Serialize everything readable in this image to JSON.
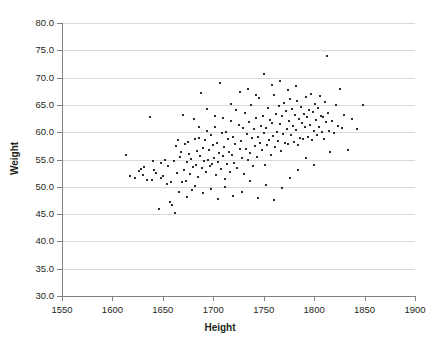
{
  "chart_data": {
    "type": "scatter",
    "title": "",
    "xlabel": "Height",
    "ylabel": "Weight",
    "xlim": [
      1550,
      1900
    ],
    "ylim": [
      30.0,
      80.0
    ],
    "xticks": [
      "1550",
      "1600",
      "1650",
      "1700",
      "1750",
      "1800",
      "1850",
      "1900"
    ],
    "yticks": [
      "30.0",
      "35.0",
      "40.0",
      "45.0",
      "50.0",
      "55.0",
      "60.0",
      "65.0",
      "70.0",
      "75.0",
      "80.0"
    ],
    "grid": true,
    "legend": null,
    "marker_color": "#2b2b2b",
    "grid_color": "#d9d9d9",
    "axis_color": "#808080",
    "n_points": 208,
    "points": [
      [
        1613,
        55.8
      ],
      [
        1617,
        52.0
      ],
      [
        1622,
        51.6
      ],
      [
        1626,
        52.9
      ],
      [
        1628,
        53.3
      ],
      [
        1631,
        53.6
      ],
      [
        1634,
        51.3
      ],
      [
        1637,
        62.8
      ],
      [
        1639,
        51.2
      ],
      [
        1641,
        53.0
      ],
      [
        1643,
        52.5
      ],
      [
        1646,
        45.9
      ],
      [
        1648,
        54.4
      ],
      [
        1650,
        52.0
      ],
      [
        1652,
        54.9
      ],
      [
        1654,
        50.6
      ],
      [
        1655,
        53.8
      ],
      [
        1657,
        47.3
      ],
      [
        1659,
        46.6
      ],
      [
        1661,
        54.7
      ],
      [
        1662,
        45.2
      ],
      [
        1663,
        57.5
      ],
      [
        1664,
        52.6
      ],
      [
        1666,
        49.1
      ],
      [
        1667,
        55.4
      ],
      [
        1668,
        56.3
      ],
      [
        1669,
        50.9
      ],
      [
        1670,
        63.2
      ],
      [
        1671,
        53.1
      ],
      [
        1672,
        57.9
      ],
      [
        1673,
        51.0
      ],
      [
        1674,
        54.5
      ],
      [
        1675,
        58.2
      ],
      [
        1676,
        56.0
      ],
      [
        1677,
        52.3
      ],
      [
        1678,
        55.1
      ],
      [
        1679,
        49.4
      ],
      [
        1680,
        53.7
      ],
      [
        1681,
        62.4
      ],
      [
        1682,
        58.8
      ],
      [
        1683,
        54.0
      ],
      [
        1684,
        56.6
      ],
      [
        1685,
        51.8
      ],
      [
        1686,
        59.0
      ],
      [
        1687,
        55.6
      ],
      [
        1688,
        67.2
      ],
      [
        1689,
        53.4
      ],
      [
        1690,
        57.1
      ],
      [
        1691,
        54.8
      ],
      [
        1692,
        58.5
      ],
      [
        1693,
        52.8
      ],
      [
        1694,
        60.3
      ],
      [
        1695,
        55.0
      ],
      [
        1696,
        56.8
      ],
      [
        1697,
        53.9
      ],
      [
        1698,
        59.4
      ],
      [
        1699,
        54.2
      ],
      [
        1700,
        57.6
      ],
      [
        1701,
        55.3
      ],
      [
        1702,
        61.0
      ],
      [
        1703,
        52.1
      ],
      [
        1704,
        58.0
      ],
      [
        1705,
        54.6
      ],
      [
        1706,
        56.1
      ],
      [
        1707,
        69.0
      ],
      [
        1708,
        53.2
      ],
      [
        1709,
        59.8
      ],
      [
        1710,
        55.7
      ],
      [
        1711,
        57.3
      ],
      [
        1712,
        51.4
      ],
      [
        1713,
        60.0
      ],
      [
        1714,
        54.1
      ],
      [
        1715,
        58.7
      ],
      [
        1716,
        56.4
      ],
      [
        1717,
        52.7
      ],
      [
        1718,
        62.0
      ],
      [
        1719,
        55.9
      ],
      [
        1720,
        59.2
      ],
      [
        1721,
        54.3
      ],
      [
        1722,
        57.8
      ],
      [
        1723,
        64.0
      ],
      [
        1724,
        53.5
      ],
      [
        1725,
        61.4
      ],
      [
        1726,
        56.9
      ],
      [
        1727,
        58.3
      ],
      [
        1728,
        55.2
      ],
      [
        1729,
        60.7
      ],
      [
        1730,
        52.4
      ],
      [
        1731,
        63.6
      ],
      [
        1732,
        57.0
      ],
      [
        1733,
        59.6
      ],
      [
        1734,
        54.9
      ],
      [
        1735,
        61.8
      ],
      [
        1736,
        56.2
      ],
      [
        1737,
        65.0
      ],
      [
        1738,
        58.9
      ],
      [
        1739,
        53.8
      ],
      [
        1740,
        60.5
      ],
      [
        1741,
        57.4
      ],
      [
        1742,
        62.6
      ],
      [
        1743,
        55.5
      ],
      [
        1744,
        59.1
      ],
      [
        1745,
        66.2
      ],
      [
        1746,
        58.1
      ],
      [
        1747,
        61.2
      ],
      [
        1748,
        56.7
      ],
      [
        1749,
        63.0
      ],
      [
        1750,
        59.9
      ],
      [
        1751,
        54.0
      ],
      [
        1752,
        60.8
      ],
      [
        1753,
        57.7
      ],
      [
        1754,
        64.4
      ],
      [
        1755,
        58.6
      ],
      [
        1756,
        62.2
      ],
      [
        1757,
        55.8
      ],
      [
        1758,
        61.6
      ],
      [
        1759,
        59.3
      ],
      [
        1760,
        66.8
      ],
      [
        1761,
        57.2
      ],
      [
        1762,
        63.4
      ],
      [
        1763,
        60.1
      ],
      [
        1764,
        58.4
      ],
      [
        1765,
        64.8
      ],
      [
        1766,
        61.5
      ],
      [
        1767,
        56.5
      ],
      [
        1768,
        62.9
      ],
      [
        1769,
        59.7
      ],
      [
        1770,
        65.4
      ],
      [
        1771,
        58.0
      ],
      [
        1772,
        63.8
      ],
      [
        1773,
        60.6
      ],
      [
        1774,
        57.9
      ],
      [
        1775,
        62.1
      ],
      [
        1776,
        66.0
      ],
      [
        1777,
        59.5
      ],
      [
        1778,
        64.2
      ],
      [
        1779,
        61.1
      ],
      [
        1780,
        58.2
      ],
      [
        1781,
        63.1
      ],
      [
        1782,
        60.4
      ],
      [
        1783,
        65.8
      ],
      [
        1784,
        57.6
      ],
      [
        1785,
        62.5
      ],
      [
        1786,
        59.0
      ],
      [
        1787,
        64.6
      ],
      [
        1788,
        61.7
      ],
      [
        1789,
        58.8
      ],
      [
        1790,
        63.3
      ],
      [
        1791,
        60.9
      ],
      [
        1792,
        66.4
      ],
      [
        1793,
        62.7
      ],
      [
        1794,
        59.2
      ],
      [
        1795,
        64.0
      ],
      [
        1796,
        61.3
      ],
      [
        1797,
        67.0
      ],
      [
        1798,
        58.5
      ],
      [
        1799,
        63.7
      ],
      [
        1800,
        60.2
      ],
      [
        1801,
        65.2
      ],
      [
        1802,
        62.3
      ],
      [
        1803,
        59.4
      ],
      [
        1804,
        64.5
      ],
      [
        1805,
        61.0
      ],
      [
        1806,
        66.6
      ],
      [
        1807,
        63.0
      ],
      [
        1808,
        60.0
      ],
      [
        1809,
        62.8
      ],
      [
        1810,
        58.7
      ],
      [
        1811,
        65.6
      ],
      [
        1812,
        61.9
      ],
      [
        1813,
        74.0
      ],
      [
        1814,
        63.5
      ],
      [
        1815,
        60.3
      ],
      [
        1816,
        56.4
      ],
      [
        1818,
        62.0
      ],
      [
        1820,
        59.8
      ],
      [
        1822,
        64.9
      ],
      [
        1824,
        61.2
      ],
      [
        1826,
        68.0
      ],
      [
        1828,
        60.7
      ],
      [
        1830,
        63.2
      ],
      [
        1834,
        56.8
      ],
      [
        1838,
        62.4
      ],
      [
        1842,
        60.5
      ],
      [
        1848,
        65.0
      ],
      [
        1665,
        58.6
      ],
      [
        1682,
        50.2
      ],
      [
        1690,
        48.8
      ],
      [
        1698,
        49.6
      ],
      [
        1705,
        47.8
      ],
      [
        1712,
        50.0
      ],
      [
        1720,
        48.4
      ],
      [
        1728,
        49.0
      ],
      [
        1736,
        51.1
      ],
      [
        1744,
        48.0
      ],
      [
        1752,
        50.4
      ],
      [
        1760,
        47.5
      ],
      [
        1768,
        49.8
      ],
      [
        1776,
        51.6
      ],
      [
        1784,
        53.0
      ],
      [
        1792,
        55.2
      ],
      [
        1800,
        54.0
      ],
      [
        1686,
        61.0
      ],
      [
        1694,
        64.2
      ],
      [
        1702,
        63.0
      ],
      [
        1710,
        62.6
      ],
      [
        1718,
        65.2
      ],
      [
        1726,
        67.4
      ],
      [
        1734,
        68.0
      ],
      [
        1742,
        66.8
      ],
      [
        1750,
        70.6
      ],
      [
        1758,
        68.6
      ],
      [
        1766,
        69.4
      ],
      [
        1774,
        67.8
      ],
      [
        1782,
        68.4
      ],
      [
        1674,
        48.2
      ],
      [
        1658,
        50.8
      ],
      [
        1648,
        51.7
      ],
      [
        1640,
        54.8
      ],
      [
        1630,
        52.2
      ]
    ]
  }
}
